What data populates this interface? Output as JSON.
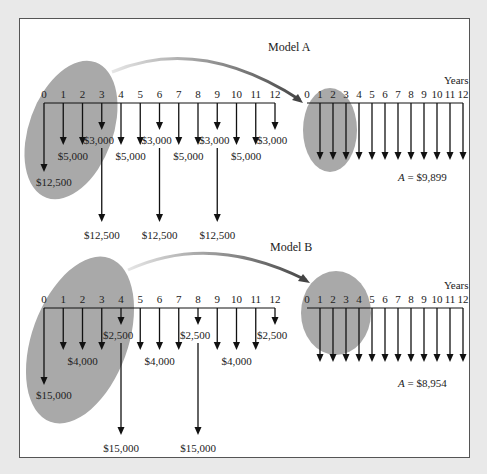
{
  "colors": {
    "background": "#e9e9e9",
    "panel": "#ffffff",
    "highlight_ellipse": "#a9a9a9",
    "arrow": "#111111",
    "curve_arrow_start": "#e0e0e0",
    "curve_arrow_end": "#444444"
  },
  "axis_unit_label": "Years",
  "models": [
    {
      "title": "Model A",
      "years": [
        "0",
        "1",
        "2",
        "3",
        "4",
        "5",
        "6",
        "7",
        "8",
        "9",
        "10",
        "11",
        "12"
      ],
      "cash_flows": [
        {
          "year": 0,
          "amount": "$12,500",
          "type": "initial"
        },
        {
          "year": 1,
          "amount": "$5,000",
          "type": "annual"
        },
        {
          "year": 2,
          "amount": "$5,000",
          "type": "annual"
        },
        {
          "year": 3,
          "amount": "$3,000",
          "type": "periodic"
        },
        {
          "year": 3,
          "amount": "$12,500",
          "type": "replacement"
        },
        {
          "year": 4,
          "amount": "$5,000",
          "type": "annual"
        },
        {
          "year": 5,
          "amount": "$5,000",
          "type": "annual"
        },
        {
          "year": 6,
          "amount": "$3,000",
          "type": "periodic"
        },
        {
          "year": 6,
          "amount": "$12,500",
          "type": "replacement"
        },
        {
          "year": 7,
          "amount": "$5,000",
          "type": "annual"
        },
        {
          "year": 8,
          "amount": "$5,000",
          "type": "annual"
        },
        {
          "year": 9,
          "amount": "$3,000",
          "type": "periodic"
        },
        {
          "year": 9,
          "amount": "$12,500",
          "type": "replacement"
        },
        {
          "year": 10,
          "amount": "$5,000",
          "type": "annual"
        },
        {
          "year": 11,
          "amount": "$5,000",
          "type": "annual"
        },
        {
          "year": 12,
          "amount": "$3,000",
          "type": "periodic"
        }
      ],
      "labels": {
        "initial": "$12,500",
        "annual": "$5,000",
        "periodic": "$3,000",
        "replacement": "$12,500"
      },
      "equivalent": {
        "symbol": "A",
        "text": " = $9,899"
      }
    },
    {
      "title": "Model B",
      "years": [
        "0",
        "1",
        "2",
        "3",
        "4",
        "5",
        "6",
        "7",
        "8",
        "9",
        "10",
        "11",
        "12"
      ],
      "cash_flows": [
        {
          "year": 0,
          "amount": "$15,000",
          "type": "initial"
        },
        {
          "year": 1,
          "amount": "$4,000",
          "type": "annual"
        },
        {
          "year": 2,
          "amount": "$4,000",
          "type": "annual"
        },
        {
          "year": 3,
          "amount": "$4,000",
          "type": "annual"
        },
        {
          "year": 4,
          "amount": "$2,500",
          "type": "periodic"
        },
        {
          "year": 4,
          "amount": "$15,000",
          "type": "replacement"
        },
        {
          "year": 5,
          "amount": "$4,000",
          "type": "annual"
        },
        {
          "year": 6,
          "amount": "$4,000",
          "type": "annual"
        },
        {
          "year": 7,
          "amount": "$4,000",
          "type": "annual"
        },
        {
          "year": 8,
          "amount": "$2,500",
          "type": "periodic"
        },
        {
          "year": 8,
          "amount": "$15,000",
          "type": "replacement"
        },
        {
          "year": 9,
          "amount": "$4,000",
          "type": "annual"
        },
        {
          "year": 10,
          "amount": "$4,000",
          "type": "annual"
        },
        {
          "year": 11,
          "amount": "$4,000",
          "type": "annual"
        },
        {
          "year": 12,
          "amount": "$2,500",
          "type": "periodic"
        }
      ],
      "labels": {
        "initial": "$15,000",
        "annual": "$4,000",
        "periodic": "$2,500",
        "replacement": "$15,000"
      },
      "equivalent": {
        "symbol": "A",
        "text": " = $8,954"
      }
    }
  ]
}
